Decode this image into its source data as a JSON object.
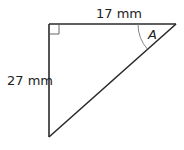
{
  "diagram": {
    "type": "right-triangle",
    "top_side_label": "17 mm",
    "left_side_label": "27 mm",
    "angle_label": "A",
    "right_angle_marker": true,
    "stroke_color": "#2a2a2a",
    "arc_color": "#777777"
  }
}
